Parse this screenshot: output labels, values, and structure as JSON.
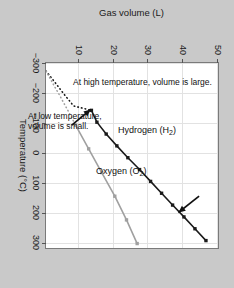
{
  "chart_data": {
    "type": "line",
    "title": "",
    "xlabel": "Temperature (°C)",
    "ylabel": "Gas volume (L)",
    "xlim": [
      -300,
      325
    ],
    "ylim": [
      0,
      50
    ],
    "xticks": [
      -300,
      -200,
      -100,
      0,
      100,
      200,
      300
    ],
    "xticklabels": [
      "−300",
      "−200",
      "−100",
      "0",
      "100",
      "200",
      "300"
    ],
    "yticks": [
      10,
      20,
      30,
      40,
      50
    ],
    "yticklabels": [
      "10",
      "20",
      "30",
      "40",
      "50"
    ],
    "grid": true,
    "legend_position": "inline-labels",
    "series": [
      {
        "name": "Hydrogen (H2)",
        "label_text": "Hydrogen (H",
        "label_sub": "2",
        "label_tail": ")",
        "color": "#1a1a1a",
        "marker": "square",
        "x": [
          -140,
          -100,
          -60,
          -20,
          20,
          60,
          100,
          140,
          180,
          220,
          260,
          300
        ],
        "y": [
          13.2,
          14.8,
          17.5,
          20.6,
          23.8,
          27.2,
          30.4,
          33.6,
          36.8,
          40.1,
          43.3,
          46.5
        ],
        "extrapolated_x": [
          -273,
          -260,
          -245,
          -230,
          -215,
          -200,
          -185,
          -170,
          -155,
          -140
        ],
        "extrapolated_y": [
          0,
          0.9,
          1.9,
          2.9,
          3.9,
          4.9,
          5.9,
          7.0,
          8.0,
          13.2
        ]
      },
      {
        "name": "Oxygen (O2)",
        "label_text": "Oxygen (O",
        "label_sub": "2",
        "label_tail": ")",
        "color": "#a0a0a0",
        "marker": "square",
        "x": [
          -90,
          -10,
          70,
          150,
          230,
          310
        ],
        "y": [
          8.6,
          12.4,
          16.2,
          20.0,
          23.4,
          26.5
        ],
        "extrapolated_x": [
          -273,
          -250,
          -220,
          -190,
          -160,
          -130,
          -90
        ],
        "extrapolated_y": [
          0,
          1.1,
          2.5,
          4.0,
          5.4,
          6.8,
          8.6
        ]
      }
    ],
    "annotations": [
      {
        "id": "high-temp-note",
        "text_line1": "At high temperature,",
        "text_line2": "volume is large.",
        "text": "At high temperature, volume is large.",
        "point_x": 200,
        "point_y": 38.0
      },
      {
        "id": "low-temp-note",
        "text_line1": "At low temperature,",
        "text_line2": "volume is small.",
        "text": "At low temperature, volume is small.",
        "point_x": -140,
        "point_y": 13.2
      }
    ],
    "colors": {
      "background": "#c9c9c9",
      "plot_background": "#ffffff",
      "grid": "#e2e2e2",
      "axis": "#7a7a7a",
      "hydrogen": "#1a1a1a",
      "oxygen": "#a0a0a0",
      "annotation": "#111111"
    }
  }
}
